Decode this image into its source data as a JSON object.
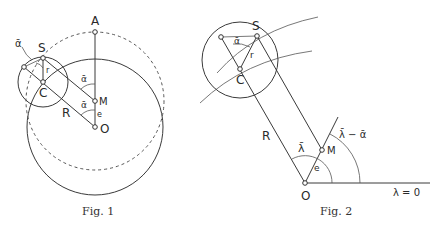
{
  "figures": [
    {
      "caption": "Fig. 1",
      "labels": {
        "A": "A",
        "S": "S",
        "C": "C",
        "M": "M",
        "O": "O",
        "R": "R",
        "r": "r",
        "e": "e",
        "alpha_bar_left": "ᾱ",
        "alpha_bar_upper": "ᾱ",
        "alpha_bar_lower": "ᾱ"
      }
    },
    {
      "caption": "Fig. 2",
      "labels": {
        "S": "S",
        "C": "C",
        "M": "M",
        "O": "O",
        "R": "R",
        "r": "r",
        "e": "e",
        "alpha_bar": "ᾱ",
        "lambda_bar": "λ̄",
        "lambda_minus_alpha": "λ̄ − ᾱ",
        "lambda_zero": "λ = 0"
      }
    }
  ],
  "colors": {
    "line": "#3a3a3a",
    "background": "#ffffff"
  }
}
